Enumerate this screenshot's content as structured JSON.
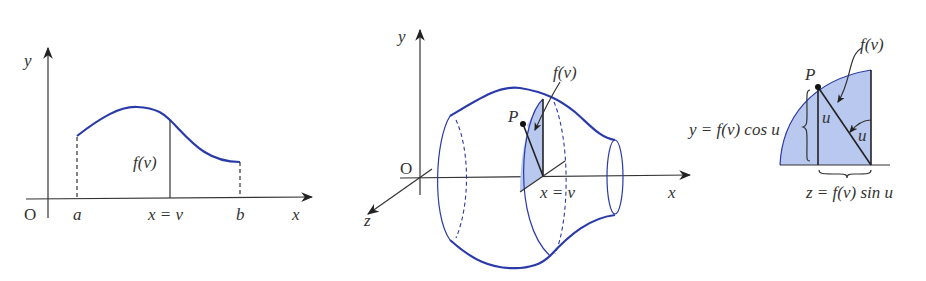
{
  "figure1": {
    "origin": "O",
    "y_axis": "y",
    "x_axis": "x",
    "a": "a",
    "b": "b",
    "xv": "x = v",
    "fv": "f(v)"
  },
  "figure2": {
    "origin": "O",
    "y_axis": "y",
    "x_axis": "x",
    "z_axis": "z",
    "point": "P",
    "fv": "f(v)",
    "xv": "x = v"
  },
  "figure3": {
    "point": "P",
    "fv": "f(v)",
    "u1": "u",
    "u2": "u",
    "y_eq": "y = f(v) cos u",
    "z_eq": "z = f(v) sin u"
  },
  "colors": {
    "curve": "#2a3aa8",
    "shade": "#b9c8ee",
    "axis": "#333333"
  }
}
